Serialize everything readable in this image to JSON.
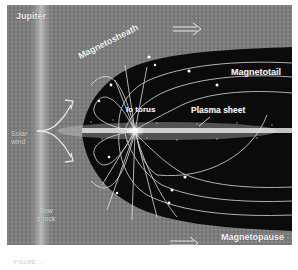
{
  "figure": {
    "labels": {
      "jupiter": "Jupiter",
      "magnetosheath": "Magnetosheath",
      "magnetotail": "Magnetotail",
      "io_torus": "Io torus",
      "plasma_sheet": "Plasma sheet",
      "solar_wind": "Solar wind",
      "bow_shock": "Bow shock",
      "magnetopause": "Magnetopause"
    },
    "colors": {
      "background_gray": "#7e7e7e",
      "magnetosphere": "#0a0a0a",
      "field_lines": "#e8e8e8",
      "bow_shock_band": "#bdbdbd"
    },
    "icons": [
      "flow-arrow-icon",
      "solar-wind-arrows-icon"
    ]
  },
  "caption": "FIGURE ..."
}
